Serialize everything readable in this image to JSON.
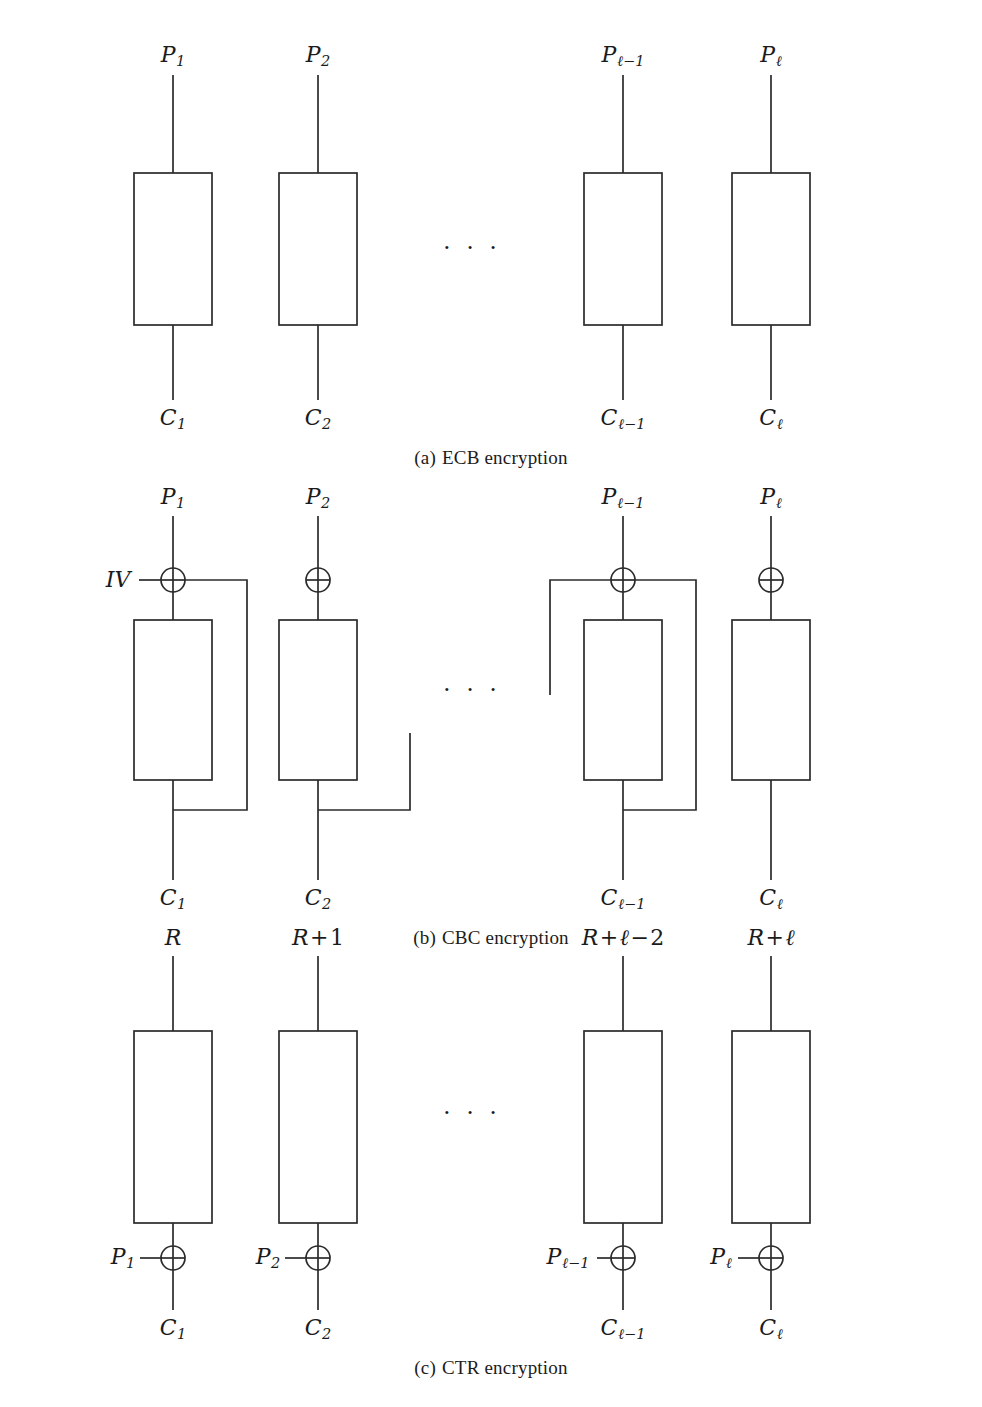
{
  "figure": {
    "kind": "block-cipher-modes-diagram",
    "width": 982,
    "height": 1407,
    "background": "#ffffff",
    "ink_color": "#2b2b2b",
    "ellipsis_glyph": "· · ·"
  },
  "panels": [
    {
      "id": "ecb",
      "caption_tag": "(a)",
      "caption_text": "ECB encryption",
      "top_labels": [
        {
          "base": "P",
          "sub": "1"
        },
        {
          "base": "P",
          "sub": "2"
        },
        {
          "base": "P",
          "sub": "ℓ−1"
        },
        {
          "base": "P",
          "sub": "ℓ"
        }
      ],
      "bottom_labels": [
        {
          "base": "C",
          "sub": "1"
        },
        {
          "base": "C",
          "sub": "2"
        },
        {
          "base": "C",
          "sub": "ℓ−1"
        },
        {
          "base": "C",
          "sub": "ℓ"
        }
      ],
      "side_labels": [],
      "xor_count": 0,
      "block_count": 4,
      "has_feedback_wires": false
    },
    {
      "id": "cbc",
      "caption_tag": "(b)",
      "caption_text": "CBC encryption",
      "top_labels": [
        {
          "base": "P",
          "sub": "1"
        },
        {
          "base": "P",
          "sub": "2"
        },
        {
          "base": "P",
          "sub": "ℓ−1"
        },
        {
          "base": "P",
          "sub": "ℓ"
        }
      ],
      "bottom_labels": [
        {
          "base": "C",
          "sub": "1"
        },
        {
          "base": "C",
          "sub": "2"
        },
        {
          "base": "C",
          "sub": "ℓ−1"
        },
        {
          "base": "C",
          "sub": "ℓ"
        }
      ],
      "side_labels": [
        {
          "base": "IV",
          "sub": "",
          "for_column": 1
        }
      ],
      "xor_count": 4,
      "block_count": 4,
      "has_feedback_wires": true
    },
    {
      "id": "ctr",
      "caption_tag": "(c)",
      "caption_text": "CTR encryption",
      "top_labels": [
        {
          "base": "R",
          "sub": ""
        },
        {
          "base": "R",
          "op1": "+",
          "num1": "1"
        },
        {
          "base": "R",
          "op1": "+",
          "ell": "ℓ",
          "op2": "−",
          "num2": "2"
        },
        {
          "base": "R",
          "op1": "+",
          "ell": "ℓ"
        }
      ],
      "bottom_labels": [
        {
          "base": "C",
          "sub": "1"
        },
        {
          "base": "C",
          "sub": "2"
        },
        {
          "base": "C",
          "sub": "ℓ−1"
        },
        {
          "base": "C",
          "sub": "ℓ"
        }
      ],
      "side_labels": [
        {
          "base": "P",
          "sub": "1",
          "for_column": 1
        },
        {
          "base": "P",
          "sub": "2",
          "for_column": 2
        },
        {
          "base": "P",
          "sub": "ℓ−1",
          "for_column": 3
        },
        {
          "base": "P",
          "sub": "ℓ",
          "for_column": 4
        }
      ],
      "xor_count": 4,
      "block_count": 4,
      "has_feedback_wires": false
    }
  ],
  "geometry": {
    "column_centers": [
      173,
      318,
      623,
      771
    ],
    "box_width": 78,
    "ellipsis_x": 472
  }
}
